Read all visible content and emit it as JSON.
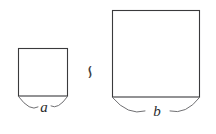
{
  "figure": {
    "background_color": "#ffffff",
    "stroke_color": "#3a3a3c",
    "brace_color": "#6f6f72",
    "label_color": "#2b2b2d",
    "relation": {
      "symbol": "∽",
      "name": "similar-to-symbol",
      "label": "is similar to"
    },
    "shapes": [
      {
        "name": "small-square",
        "kind": "square",
        "side_label": "a",
        "x": 18,
        "y": 48,
        "width": 50,
        "height": 48
      },
      {
        "name": "large-square",
        "kind": "square",
        "side_label": "b",
        "x": 112,
        "y": 10,
        "width": 88,
        "height": 87
      }
    ],
    "labels": {
      "small_side": "a",
      "large_side": "b"
    }
  }
}
